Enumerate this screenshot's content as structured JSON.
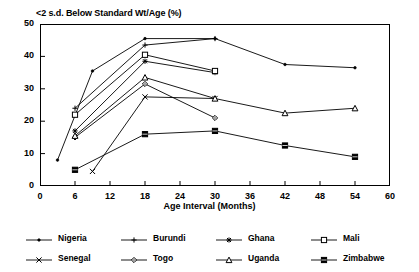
{
  "chart_data": {
    "type": "line",
    "title": "<2 s.d. Below Standard Wt/Age (%)",
    "xlabel": "Age Interval (Months)",
    "ylabel": "",
    "xlim": [
      0,
      60
    ],
    "ylim": [
      0,
      50
    ],
    "xticks": [
      0,
      6,
      12,
      18,
      24,
      30,
      36,
      42,
      48,
      54,
      60
    ],
    "yticks": [
      0,
      10,
      20,
      30,
      40,
      50
    ],
    "grid": false,
    "legend_position": "bottom",
    "series": [
      {
        "name": "Nigeria",
        "marker": "dot",
        "x": [
          3,
          9,
          18,
          30,
          42,
          54
        ],
        "y": [
          8,
          35.5,
          45.5,
          45.5,
          37.5,
          36.5
        ]
      },
      {
        "name": "Burundi",
        "marker": "plus",
        "x": [
          6,
          18,
          30
        ],
        "y": [
          24,
          43.5,
          45.5
        ]
      },
      {
        "name": "Ghana",
        "marker": "asterisk",
        "x": [
          6,
          18,
          30
        ],
        "y": [
          17,
          38.5,
          35
        ]
      },
      {
        "name": "Mali",
        "marker": "open-square",
        "x": [
          6,
          18,
          30
        ],
        "y": [
          22,
          40.5,
          35.5
        ]
      },
      {
        "name": "Senegal",
        "marker": "x",
        "x": [
          9,
          18,
          30
        ],
        "y": [
          4.5,
          27.5,
          27
        ]
      },
      {
        "name": "Togo",
        "marker": "diamond",
        "x": [
          6,
          18,
          30
        ],
        "y": [
          15,
          31.5,
          21
        ]
      },
      {
        "name": "Uganda",
        "marker": "triangle",
        "x": [
          6,
          18,
          30,
          42,
          54
        ],
        "y": [
          15.5,
          33.5,
          27,
          22.5,
          24
        ]
      },
      {
        "name": "Zimbabwe",
        "marker": "filled-square",
        "x": [
          6,
          18,
          30,
          42,
          54
        ],
        "y": [
          5,
          16,
          17,
          12.5,
          9
        ]
      }
    ]
  },
  "legend": {
    "rows": [
      [
        {
          "label": "Nigeria",
          "marker": "dot"
        },
        {
          "label": "Burundi",
          "marker": "plus"
        },
        {
          "label": "Ghana",
          "marker": "asterisk"
        },
        {
          "label": "Mali",
          "marker": "open-square"
        }
      ],
      [
        {
          "label": "Senegal",
          "marker": "x"
        },
        {
          "label": "Togo",
          "marker": "diamond"
        },
        {
          "label": "Uganda",
          "marker": "triangle"
        },
        {
          "label": "Zimbabwe",
          "marker": "filled-square"
        }
      ]
    ]
  },
  "colors": {
    "line": "#000000",
    "axis": "#000000",
    "background": "#ffffff"
  }
}
